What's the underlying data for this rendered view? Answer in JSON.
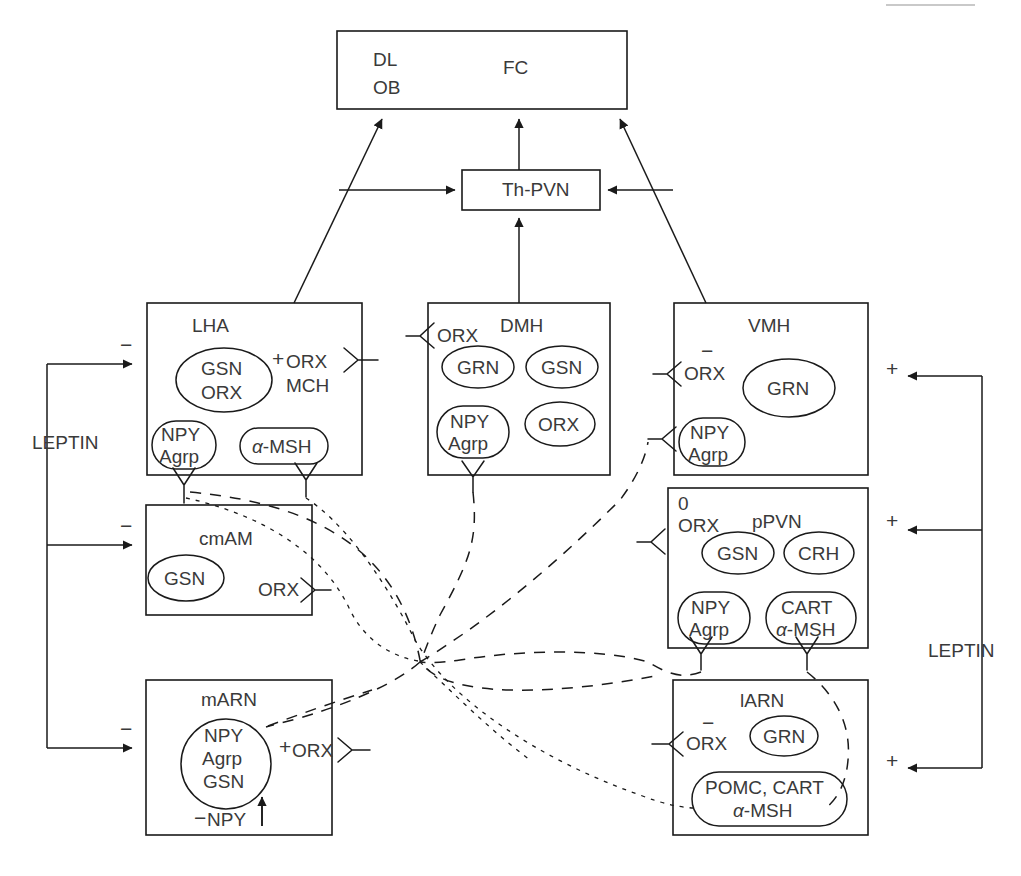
{
  "diagram": {
    "title_caption": "",
    "nodes": {
      "cortex": {
        "label_a": "DL",
        "label_b": "OB",
        "label_c": "FC"
      },
      "thpvn": {
        "label": "Th-PVN"
      },
      "lha": {
        "label": "LHA",
        "ellipses": [
          "GSN\nORX",
          "NPY\nAgrp",
          "α-MSH"
        ],
        "ellipse1_l1": "GSN",
        "ellipse1_l2": "ORX",
        "ellipse2_l1": "NPY",
        "ellipse2_l2": "Agrp",
        "ellipse3_l1": "α-MSH",
        "out_sign": "+",
        "out_l1": "ORX",
        "out_l2": "MCH",
        "in_sign": "−"
      },
      "dmh": {
        "label": "DMH",
        "ellipse1": "GRN",
        "ellipse2": "GSN",
        "ellipse3_l1": "NPY",
        "ellipse3_l2": "Agrp",
        "ellipse4": "ORX",
        "in_label": "ORX"
      },
      "vmh": {
        "label": "VMH",
        "ellipse1": "GRN",
        "ellipse2_l1": "NPY",
        "ellipse2_l2": "Agrp",
        "in_sign": "−",
        "in_label": "ORX",
        "leptin_sign": "+"
      },
      "cmam": {
        "label": "cmAM",
        "ellipse1": "GSN",
        "out_label": "ORX",
        "in_sign": "−"
      },
      "ppvn": {
        "label": "pPVN",
        "in_sign": "0",
        "in_label": "ORX",
        "ellipse1": "GSN",
        "ellipse2": "CRH",
        "ellipse3_l1": "NPY",
        "ellipse3_l2": "Agrp",
        "ellipse4_l1": "CART",
        "ellipse4_l2": "α-MSH",
        "leptin_sign": "+"
      },
      "marn": {
        "label": "mARN",
        "ellipse1_l1": "NPY",
        "ellipse1_l2": "Agrp",
        "ellipse1_l3": "GSN",
        "out_sign": "+",
        "out_label": "ORX",
        "bottom_sign": "−",
        "bottom_label": "NPY",
        "bottom_arrow": "↑",
        "in_sign": "−"
      },
      "larn": {
        "label": "lARN",
        "in_sign": "−",
        "in_label": "ORX",
        "ellipse1": "GRN",
        "ellipse2_l1": "POMC, CART",
        "ellipse2_l2": "α-MSH",
        "leptin_sign": "+"
      }
    },
    "side_labels": {
      "leptin_left": "LEPTIN",
      "leptin_right": "LEPTIN"
    },
    "colors": {
      "stroke": "#1a1a1a",
      "text": "#3a3a3a",
      "background": "#ffffff"
    }
  }
}
